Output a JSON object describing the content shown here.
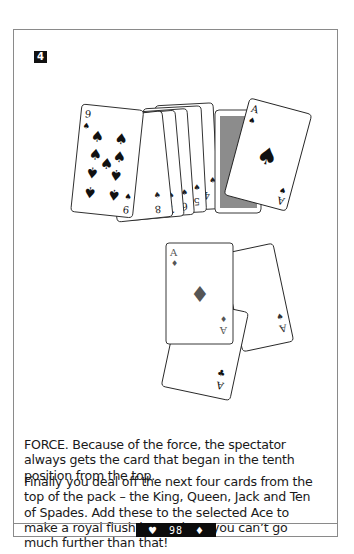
{
  "page": {
    "step_number": "4",
    "paragraphs": [
      "FORCE. Because of the force, the spectator always gets the card that began in the tenth position from the top.",
      "Finally you deal off the next four cards from the top of the pack – the King, Queen, Jack and Ten of Spades. Add these to the selected Ace to make a royal flush in Spades –  you can’t go much further than that!"
    ],
    "footer": {
      "left_icon": "heart-icon",
      "left_glyph": "♥",
      "page_number": "98",
      "right_icon": "diamond-icon",
      "right_glyph": "♦"
    }
  },
  "illustrations": {
    "spade_fan": {
      "cards": [
        {
          "rank": "9",
          "suit": "♠"
        },
        {
          "rank": "8",
          "suit": "♠"
        },
        {
          "rank": "7",
          "suit": "♠"
        },
        {
          "rank": "6",
          "suit": "♠"
        },
        {
          "rank": "5",
          "suit": "♠"
        },
        {
          "rank": "4",
          "suit": "♠"
        }
      ]
    },
    "ace_over_deck": {
      "rank": "A",
      "suit": "♠"
    },
    "three_aces": [
      {
        "rank": "A",
        "suit": "♦"
      },
      {
        "rank": "A",
        "suit": "♣"
      },
      {
        "rank": "A",
        "suit": "♠"
      }
    ]
  },
  "colors": {
    "frame": "#8a8a8a",
    "text": "#1a1a1a",
    "card_back": "#8c8c8c",
    "diamond_pip": "#555555",
    "footer_bg": "#0c0c0c"
  }
}
